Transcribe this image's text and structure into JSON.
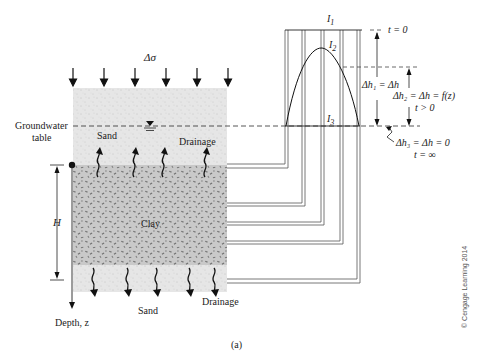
{
  "figure": {
    "caption": "(a)",
    "copyright": "© Cengage Learning 2014",
    "load_label": "Δσ",
    "groundwater_label_line1": "Groundwater",
    "groundwater_label_line2": "table",
    "top_layer": {
      "label": "Sand",
      "drainage_label": "Drainage",
      "color": "#e4e4e4"
    },
    "clay_layer": {
      "label": "Clay",
      "color": "#c8c8c8"
    },
    "bottom_layer": {
      "label": "Sand",
      "drainage_label": "Drainage",
      "color": "#e4e4e4"
    },
    "thickness_label": "H",
    "depth_label": "Depth, z",
    "isochrones": {
      "I1": "I",
      "I1_sub": "1",
      "I2": "I",
      "I2_sub": "2",
      "I3": "I",
      "I3_sub": "3"
    },
    "annotations": {
      "t0": "t = 0",
      "dh1": "Δh₁ = Δh",
      "dh2": "Δh₂ = Δh = f(z)",
      "t_gt0": "t > 0",
      "dh3": "Δh₃ = Δh = 0",
      "t_inf": "t = ∞"
    },
    "load_arrow_count": 6,
    "standpipe_count": 5
  }
}
